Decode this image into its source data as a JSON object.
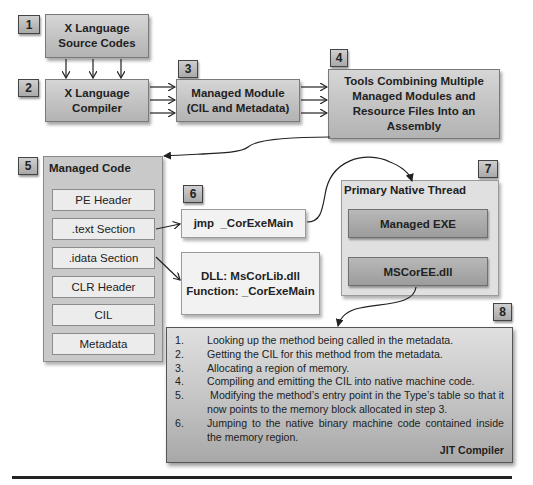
{
  "badges": {
    "b1": "1",
    "b2": "2",
    "b3": "3",
    "b4": "4",
    "b5": "5",
    "b6": "6",
    "b7": "7",
    "b8": "8"
  },
  "nodes": {
    "source_codes": {
      "line1": "X Language",
      "line2": "Source Codes"
    },
    "compiler": {
      "line1": "X Language",
      "line2": "Compiler"
    },
    "managed_module": {
      "line1": "Managed Module",
      "line2": "(CIL and Metadata)"
    },
    "assembly_tools": {
      "line1": "Tools Combining Multiple",
      "line2": "Managed Modules and",
      "line3": "Resource Files Into an",
      "line4": "Assembly"
    }
  },
  "managed_code": {
    "title": "Managed Code",
    "items": [
      "PE Header",
      ".text Section",
      ".idata Section",
      "CLR Header",
      "CIL",
      "Metadata"
    ]
  },
  "jump": {
    "label": "jmp  _CorExeMain"
  },
  "import": {
    "line1": "DLL: MsCorLib.dll",
    "line2": "Function: _CorExeMain"
  },
  "native_thread": {
    "title": "Primary Native Thread",
    "items": [
      "Managed EXE",
      "MSCorEE.dll"
    ]
  },
  "jit": {
    "label": "JIT Compiler",
    "steps": [
      {
        "num": "1.",
        "text": "Looking up the method being called in the metadata."
      },
      {
        "num": "2.",
        "text": "Getting the CIL for this method from the metadata."
      },
      {
        "num": "3.",
        "text": "Allocating a region of memory."
      },
      {
        "num": "4.",
        "text": "Compiling and emitting the CIL into native machine code."
      },
      {
        "num": "5.",
        "text": " Modifying the method’s entry point in the Type’s table so that it now points to the memory block allocated in step 3."
      },
      {
        "num": "6.",
        "text": "Jumping to the native binary machine code contained inside the memory region."
      }
    ]
  },
  "colors": {
    "box_fill": "#c2c2c2",
    "panel_fill": "#c9c9c9",
    "item_fill": "#ececec",
    "border": "#7a7a7a",
    "line": "#222222"
  }
}
